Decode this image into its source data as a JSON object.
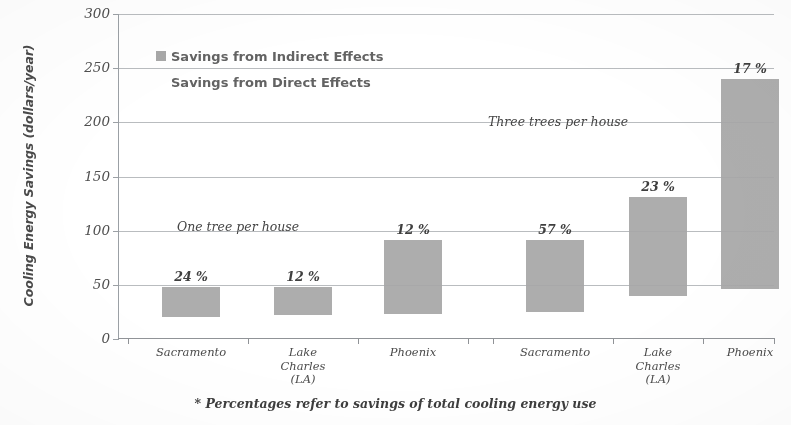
{
  "chart_data": {
    "type": "bar",
    "title": "",
    "xlabel": "",
    "ylabel": "Cooling Energy Savings (dollars/year)",
    "ylim": [
      0,
      300
    ],
    "yticks": [
      0,
      50,
      100,
      150,
      200,
      250,
      300
    ],
    "grid": true,
    "legend_position": "upper-left-inside",
    "footnote": "* Percentages refer to savings of  total cooling energy use",
    "categories": [
      "Sacramento",
      "Lake\nCharles\n(LA)",
      "Phoenix",
      "Sacramento",
      "Lake\nCharles\n(LA)",
      "Phoenix"
    ],
    "groups": [
      {
        "name": "One tree per house",
        "annotation": "One tree per house",
        "categories": [
          "Sacramento",
          "Lake Charles (LA)",
          "Phoenix"
        ]
      },
      {
        "name": "Three trees per house",
        "annotation": "Three trees per house",
        "categories": [
          "Sacramento",
          "Lake Charles (LA)",
          "Phoenix"
        ]
      }
    ],
    "series": [
      {
        "name": "Savings from Direct Effects",
        "values": [
          20,
          22,
          23,
          25,
          40,
          46
        ]
      },
      {
        "name": "Savings from Indirect Effects",
        "values": [
          28,
          26,
          68,
          66,
          91,
          194
        ]
      }
    ],
    "bars": [
      {
        "category": "Sacramento",
        "group": "One tree per house",
        "base": 20,
        "top": 48,
        "total": 48,
        "pct_label": "24 %",
        "pct_value": 24
      },
      {
        "category": "Lake Charles (LA)",
        "group": "One tree per house",
        "base": 22,
        "top": 48,
        "total": 48,
        "pct_label": "12 %",
        "pct_value": 12
      },
      {
        "category": "Phoenix",
        "group": "One tree per house",
        "base": 23,
        "top": 91,
        "total": 91,
        "pct_label": "12 %",
        "pct_value": 12
      },
      {
        "category": "Sacramento",
        "group": "Three trees per house",
        "base": 25,
        "top": 91,
        "total": 91,
        "pct_label": "57 %",
        "pct_value": 57
      },
      {
        "category": "Lake Charles (LA)",
        "group": "Three trees per house",
        "base": 40,
        "top": 131,
        "total": 131,
        "pct_label": "23 %",
        "pct_value": 23
      },
      {
        "category": "Phoenix",
        "group": "Three trees per house",
        "base": 46,
        "top": 240,
        "total": 240,
        "pct_label": "17 %",
        "pct_value": 17
      }
    ],
    "legend": [
      {
        "label": "Savings from Indirect Effects",
        "swatch": true
      },
      {
        "label": "Savings from Direct Effects",
        "swatch": false
      }
    ],
    "colors": {
      "bar_fill": "#a7a7a7",
      "gridline": "#b9bcc0",
      "axis": "#8f9398",
      "text": "#4a4a4a"
    }
  }
}
